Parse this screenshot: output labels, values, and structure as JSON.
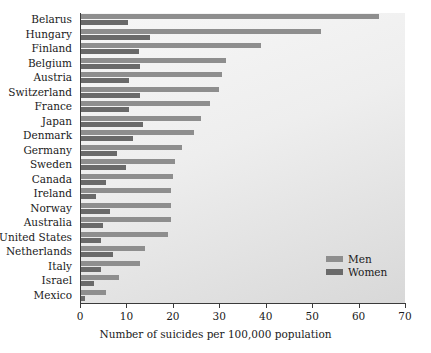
{
  "chart_data": {
    "type": "bar",
    "orientation": "horizontal",
    "title": "",
    "xlabel": "Number of suicides per 100,000 population",
    "ylabel": "",
    "xlim": [
      0,
      70
    ],
    "xticks": [
      0,
      10,
      20,
      30,
      40,
      50,
      60,
      70
    ],
    "grid": false,
    "legend_position": "inside-right",
    "categories": [
      "Belarus",
      "Hungary",
      "Finland",
      "Belgium",
      "Austria",
      "Switzerland",
      "France",
      "Japan",
      "Denmark",
      "Germany",
      "Sweden",
      "Canada",
      "Ireland",
      "Norway",
      "Australia",
      "United States",
      "Netherlands",
      "Italy",
      "Israel",
      "Mexico"
    ],
    "series": [
      {
        "name": "Men",
        "color": "#8e8e8e",
        "values": [
          64.5,
          52.0,
          39.0,
          31.5,
          30.5,
          30.0,
          28.0,
          26.0,
          24.5,
          22.0,
          20.5,
          20.0,
          19.5,
          19.5,
          19.5,
          19.0,
          14.0,
          13.0,
          8.5,
          5.5
        ]
      },
      {
        "name": "Women",
        "color": "#6a6a6a",
        "values": [
          10.3,
          15.0,
          12.7,
          13.0,
          10.5,
          13.0,
          10.5,
          13.5,
          11.5,
          8.0,
          10.0,
          5.5,
          3.5,
          6.5,
          5.0,
          4.5,
          7.0,
          4.5,
          3.0,
          1.0
        ]
      }
    ]
  },
  "legend": {
    "items": [
      {
        "label": "Men"
      },
      {
        "label": "Women"
      }
    ]
  },
  "axis": {
    "x_title": "Number of suicides per 100,000 population"
  }
}
